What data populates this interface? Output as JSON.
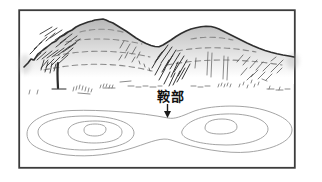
{
  "figure": {
    "saddle_label": "鞍部"
  },
  "colors": {
    "frame": "#3c3c3c",
    "ridge_line": "#2f2f2f",
    "hatch_dark": "#383838",
    "hatch_light": "#5a5a5a",
    "dashed_contour": "#8a8a8a",
    "map_contour": "#9a9a9a",
    "label_text": "#111111",
    "arrow": "#1a1a1a"
  }
}
